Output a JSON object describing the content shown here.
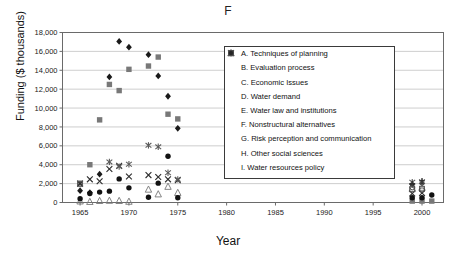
{
  "chart_data": {
    "type": "scatter",
    "title": "F",
    "xlabel": "Year",
    "ylabel": "Funding ($ thousands)",
    "xlim": [
      1963.2,
      2002.2
    ],
    "ylim": [
      0,
      18000
    ],
    "xticks": [
      "1965",
      "1970",
      "1975",
      "1980",
      "1985",
      "1990",
      "1995",
      "2000"
    ],
    "xtick_values": [
      1965,
      1970,
      1975,
      1980,
      1985,
      1990,
      1995,
      2000
    ],
    "yticks": [
      "0",
      "2,000",
      "4,000",
      "6,000",
      "8,000",
      "10,000",
      "12,000",
      "14,000",
      "16,000",
      "18,000"
    ],
    "ytick_values": [
      0,
      2000,
      4000,
      6000,
      8000,
      10000,
      12000,
      14000,
      16000,
      18000
    ],
    "grid": "horizontal",
    "legend_position": "inside-right",
    "series": [
      {
        "key": "A",
        "name": "A. Techniques of planning",
        "marker": "filled-diamond",
        "color": "#1a1a1a",
        "points": [
          [
            1965,
            1250
          ],
          [
            1966,
            1050
          ],
          [
            1967,
            3000
          ],
          [
            1968,
            13300
          ],
          [
            1969,
            17050
          ],
          [
            1970,
            16450
          ],
          [
            1972,
            15650
          ],
          [
            1973,
            13400
          ],
          [
            1974,
            11250
          ],
          [
            1975,
            7850
          ],
          [
            1999,
            1900
          ],
          [
            2000,
            2050
          ]
        ]
      },
      {
        "key": "B",
        "name": "B. Evaluation process",
        "marker": "filled-square",
        "color": "#787878",
        "points": [
          [
            1965,
            2050
          ],
          [
            1966,
            4000
          ],
          [
            1967,
            8750
          ],
          [
            1968,
            12500
          ],
          [
            1969,
            11850
          ],
          [
            1970,
            14100
          ],
          [
            1972,
            14450
          ],
          [
            1973,
            15400
          ],
          [
            1974,
            9350
          ],
          [
            1975,
            8850
          ],
          [
            1999,
            150
          ],
          [
            2000,
            150
          ],
          [
            2001,
            150
          ]
        ]
      },
      {
        "key": "C",
        "name": "C. Economic Issues",
        "marker": "open-triangle",
        "color": "#777777",
        "points": [
          [
            1965,
            150
          ],
          [
            1966,
            100
          ],
          [
            1967,
            200
          ],
          [
            1968,
            220
          ],
          [
            1969,
            200
          ],
          [
            1970,
            120
          ],
          [
            1972,
            1400
          ],
          [
            1973,
            900
          ],
          [
            1974,
            1700
          ],
          [
            1975,
            1050
          ],
          [
            1999,
            1500
          ],
          [
            2000,
            1600
          ]
        ]
      },
      {
        "key": "D",
        "name": "D. Water demand",
        "marker": "cross-x",
        "color": "#2b2b2b",
        "points": [
          [
            1965,
            2000
          ],
          [
            1966,
            2450
          ],
          [
            1967,
            2250
          ],
          [
            1968,
            3550
          ],
          [
            1969,
            3900
          ],
          [
            1970,
            2750
          ],
          [
            1972,
            2900
          ],
          [
            1973,
            2700
          ],
          [
            1974,
            2450
          ],
          [
            1975,
            2350
          ],
          [
            1999,
            950
          ],
          [
            2000,
            1000
          ]
        ]
      },
      {
        "key": "E",
        "name": "E. Water law and institutions",
        "marker": "asterisk",
        "color": "#5a5a5a",
        "points": [
          [
            1968,
            4300
          ],
          [
            1969,
            3800
          ],
          [
            1970,
            4050
          ],
          [
            1972,
            6050
          ],
          [
            1973,
            5900
          ],
          [
            1974,
            3150
          ],
          [
            1975,
            2450
          ],
          [
            1999,
            2150
          ],
          [
            2000,
            2200
          ]
        ]
      },
      {
        "key": "F",
        "name": "F. Nonstructural alternatives",
        "marker": "filled-circle",
        "color": "#121212",
        "points": [
          [
            1965,
            400
          ],
          [
            1966,
            950
          ],
          [
            1967,
            1100
          ],
          [
            1968,
            1200
          ],
          [
            1969,
            2500
          ],
          [
            1970,
            1550
          ],
          [
            1972,
            550
          ],
          [
            1973,
            2050
          ],
          [
            1974,
            4900
          ],
          [
            1975,
            500
          ],
          [
            1999,
            500
          ],
          [
            2000,
            500
          ],
          [
            2001,
            800
          ]
        ]
      },
      {
        "key": "G",
        "name": "G. Risk perception and communication",
        "marker": "plus",
        "color": "#2b2b2b",
        "points": [
          [
            1999,
            2000
          ],
          [
            2000,
            2300
          ]
        ]
      },
      {
        "key": "H",
        "name": "H. Other social sciences",
        "marker": "open-square",
        "color": "#555555",
        "points": [
          [
            1965,
            1950
          ],
          [
            1999,
            1400
          ],
          [
            2000,
            1450
          ]
        ]
      },
      {
        "key": "I",
        "name": "I. Water resources policy",
        "marker": "open-circle",
        "color": "#444444",
        "points": [
          [
            1999,
            1600
          ],
          [
            2000,
            1300
          ]
        ]
      }
    ]
  },
  "legend": {
    "items": [
      {
        "marker": "filled-diamond",
        "label": "A. Techniques of planning"
      },
      {
        "marker": "filled-square",
        "label": "B. Evaluation process"
      },
      {
        "marker": "open-triangle",
        "label": "C. Economic Issues"
      },
      {
        "marker": "cross-x",
        "label": "D. Water demand"
      },
      {
        "marker": "asterisk",
        "label": "E. Water law and institutions"
      },
      {
        "marker": "filled-circle",
        "label": "F. Nonstructural alternatives"
      },
      {
        "marker": "plus",
        "label": "G. Risk perception and communication"
      },
      {
        "marker": "open-square",
        "label": "H. Other social sciences"
      },
      {
        "marker": "open-circle",
        "label": "I. Water resources policy"
      }
    ]
  }
}
